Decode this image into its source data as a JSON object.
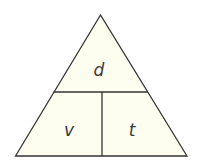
{
  "diagram": {
    "type": "formula-triangle",
    "fill_color": "#fdfdf0",
    "stroke_color": "#333333",
    "top": {
      "label": "d"
    },
    "bottom_left": {
      "label": "v"
    },
    "bottom_right": {
      "label": "t"
    }
  }
}
